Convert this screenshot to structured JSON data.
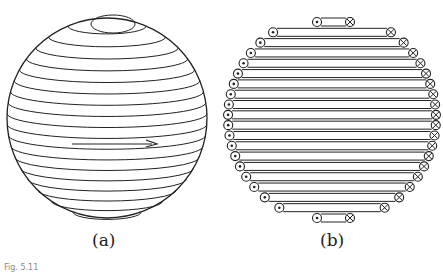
{
  "panels": [
    {
      "id": "a",
      "label": "(a)",
      "description": "Sphere wound with horizontal coil turns, arrow indicating current direction",
      "turns": 18
    },
    {
      "id": "b",
      "label": "(b)",
      "description": "Cross-section of spherical coil: dots (current out) on left, crosses (current in) on right",
      "rows": 20
    }
  ],
  "caption": "Fig. 5.11",
  "colors": {
    "stroke": "#222222",
    "background": "#ffffff"
  }
}
